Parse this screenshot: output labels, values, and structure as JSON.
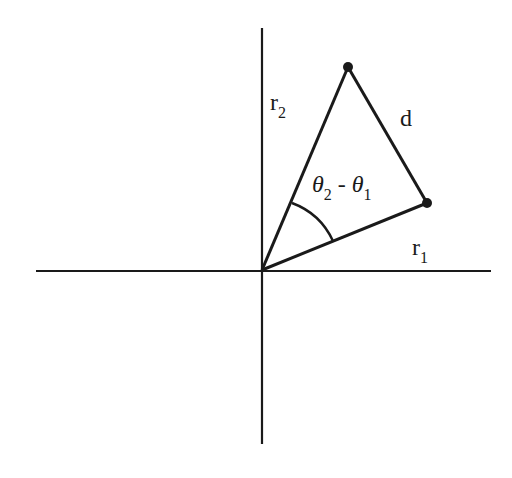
{
  "diagram": {
    "title": "",
    "colors": {
      "line": "#1a1a1a",
      "background": "#ffffff"
    },
    "axes": {
      "origin": [
        262,
        270
      ],
      "x_axis": {
        "from": [
          36,
          271
        ],
        "to": [
          491,
          271
        ]
      },
      "y_axis": {
        "from": [
          262,
          28
        ],
        "to": [
          262,
          444
        ]
      }
    },
    "points": {
      "P1": [
        427,
        203
      ],
      "P2": [
        348,
        67
      ]
    },
    "labels": {
      "r2": {
        "main": "r",
        "sub": "2"
      },
      "r1": {
        "main": "r",
        "sub": "1"
      },
      "d": "d",
      "angle": {
        "theta": "θ",
        "sub2": "2",
        "minus": "-",
        "sub1": "1"
      }
    }
  }
}
